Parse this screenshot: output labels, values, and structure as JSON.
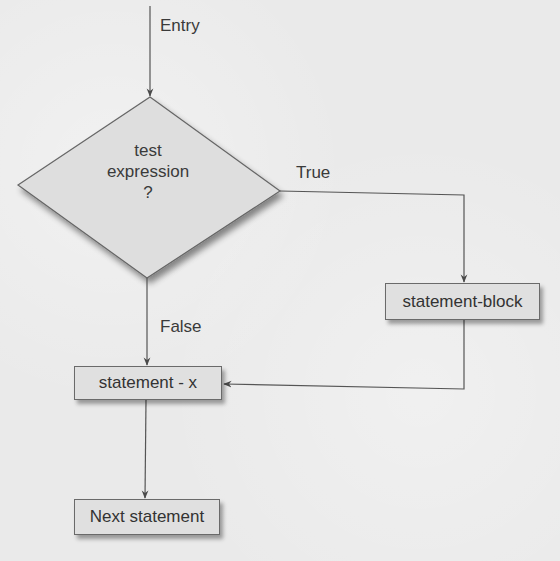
{
  "diagram": {
    "type": "flowchart",
    "colors": {
      "background": "#eaeaea",
      "node_fill": "#e0e0e0",
      "stroke": "#555555",
      "text": "#333333"
    },
    "entry": {
      "label": "Entry"
    },
    "decision": {
      "lines": [
        "test",
        "expression",
        "?"
      ]
    },
    "branches": {
      "true_label": "True",
      "false_label": "False"
    },
    "nodes": {
      "statement_block": "statement-block",
      "statement_x": "statement - x",
      "next_statement": "Next statement"
    },
    "edges": [
      {
        "from": "entry",
        "to": "decision"
      },
      {
        "from": "decision",
        "to": "statement_block",
        "label": "True"
      },
      {
        "from": "decision",
        "to": "statement_x",
        "label": "False"
      },
      {
        "from": "statement_block",
        "to": "statement_x"
      },
      {
        "from": "statement_x",
        "to": "next_statement"
      }
    ]
  }
}
